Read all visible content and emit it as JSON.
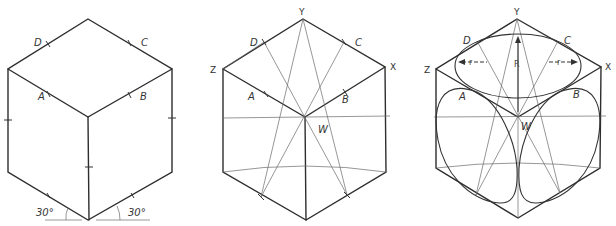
{
  "figure": {
    "panels": [
      {
        "id": "cube-basic",
        "labels": {
          "D": "D",
          "C": "C",
          "A": "A",
          "B": "B"
        },
        "angle_left": "30°",
        "angle_right": "30°"
      },
      {
        "id": "cube-construction",
        "labels": {
          "Y": "Y",
          "Z": "Z",
          "X": "X",
          "D": "D",
          "C": "C",
          "A": "A",
          "B": "B",
          "W": "W"
        }
      },
      {
        "id": "cube-ellipses",
        "labels": {
          "Y": "Y",
          "Z": "Z",
          "X": "X",
          "D": "D",
          "C": "C",
          "A": "A",
          "B": "B",
          "W": "W",
          "R": "R",
          "r_left": "r",
          "r_right": "r"
        }
      }
    ]
  }
}
